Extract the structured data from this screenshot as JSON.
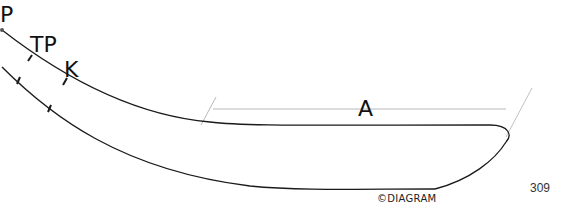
{
  "diagram": {
    "labels": {
      "p": "P",
      "tp": "TP",
      "k": "K",
      "a": "A"
    },
    "copyright": "©DIAGRAM",
    "page_number": "309",
    "colors": {
      "outline": "#1a1a1a",
      "dimension_line": "#b5b5b5",
      "background": "#ffffff"
    }
  }
}
